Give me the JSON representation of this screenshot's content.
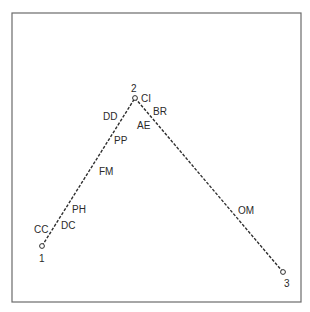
{
  "diagram": {
    "frame": {
      "x": 12,
      "y": 13,
      "width": 289,
      "height": 289
    },
    "nodes": [
      {
        "id": "1",
        "label": "1",
        "x": 42,
        "y": 246,
        "label_x": 39,
        "label_y": 262
      },
      {
        "id": "2",
        "label": "2",
        "x": 135,
        "y": 98,
        "label_x": 131,
        "label_y": 92
      },
      {
        "id": "3",
        "label": "3",
        "x": 283,
        "y": 272,
        "label_x": 284,
        "label_y": 287
      }
    ],
    "segments": [
      {
        "from": "1",
        "to": "2"
      },
      {
        "from": "2",
        "to": "3"
      }
    ],
    "points": [
      {
        "label": "CC",
        "x": 34,
        "y": 233
      },
      {
        "label": "DC",
        "x": 61,
        "y": 229
      },
      {
        "label": "PH",
        "x": 72,
        "y": 213
      },
      {
        "label": "FM",
        "x": 99,
        "y": 175
      },
      {
        "label": "PP",
        "x": 114,
        "y": 144
      },
      {
        "label": "DD",
        "x": 103,
        "y": 120
      },
      {
        "label": "CI",
        "x": 141,
        "y": 102
      },
      {
        "label": "BR",
        "x": 153,
        "y": 115
      },
      {
        "label": "AE",
        "x": 137,
        "y": 129
      },
      {
        "label": "OM",
        "x": 238,
        "y": 214
      }
    ],
    "colors": {
      "ink": "#2e2e2e",
      "frame": "#6b6b6b",
      "background": "#ffffff"
    }
  }
}
